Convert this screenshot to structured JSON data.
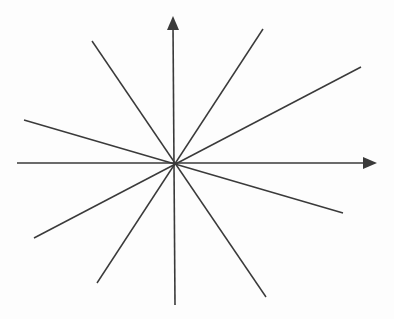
{
  "diagram": {
    "stroke_color": "#3a3a3a",
    "background": "#fdfdfd",
    "origin": {
      "x": 174,
      "y": 163
    },
    "axes": {
      "x_axis": {
        "x1": 17,
        "y1": 163,
        "x2": 370,
        "y2": 163,
        "arrow_tip": {
          "x": 377,
          "y": 163
        }
      },
      "y_axis": {
        "x1": 175,
        "y1": 305,
        "x2": 173,
        "y2": 26,
        "arrow_tip": {
          "x": 173,
          "y": 16
        }
      }
    },
    "lines": [
      {
        "x1": 92,
        "y1": 41,
        "x2": 266,
        "y2": 297
      },
      {
        "x1": 263,
        "y1": 29,
        "x2": 97,
        "y2": 283
      },
      {
        "x1": 361,
        "y1": 67,
        "x2": 34,
        "y2": 238
      },
      {
        "x1": 24,
        "y1": 120,
        "x2": 343,
        "y2": 213
      }
    ]
  }
}
